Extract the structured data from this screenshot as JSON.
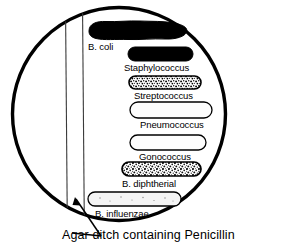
{
  "figure": {
    "caption": "Agar ditch containing Penicillin",
    "colors": {
      "ink": "#000000",
      "background": "#ffffff",
      "dish_outline": "#000000",
      "ditch_line": "#555555"
    },
    "plate": {
      "shape": "circle",
      "label": "petri-dish"
    },
    "ditch": {
      "label": "Agar ditch containing Penicillin",
      "orientation": "vertical",
      "left_line_x": 65,
      "right_line_x": 82
    },
    "streaks": [
      {
        "label": "B. coli",
        "growth": "heavy",
        "fill": "solid-black",
        "label_position": "below-left",
        "x": 85,
        "y": 21,
        "width": 102,
        "height": 19,
        "label_x": 88,
        "label_y": 42
      },
      {
        "label": "Staphylococcus",
        "growth": "heavy",
        "fill": "solid-black",
        "label_position": "below-left",
        "x": 128,
        "y": 47,
        "width": 65,
        "height": 14,
        "label_x": 124,
        "label_y": 63
      },
      {
        "label": "Streptococcus",
        "growth": "moderate",
        "fill": "stippled",
        "label_position": "below-left",
        "x": 129,
        "y": 76,
        "width": 72,
        "height": 13,
        "label_x": 134,
        "label_y": 91
      },
      {
        "label": "Pneumococcus",
        "growth": "inhibited",
        "fill": "outline",
        "label_position": "below-left",
        "x": 130,
        "y": 102,
        "width": 82,
        "height": 16,
        "label_x": 140,
        "label_y": 120
      },
      {
        "label": "Gonococcus",
        "growth": "inhibited",
        "fill": "outline",
        "label_position": "below-left",
        "x": 130,
        "y": 135,
        "width": 76,
        "height": 15,
        "label_x": 139,
        "label_y": 152
      },
      {
        "label": "B. diphtherial",
        "growth": "moderate",
        "fill": "stippled",
        "label_position": "below-left",
        "x": 122,
        "y": 162,
        "width": 79,
        "height": 14,
        "label_x": 122,
        "label_y": 179
      },
      {
        "label": "B. influenzae",
        "growth": "inhibited",
        "fill": "outline",
        "label_position": "below-left",
        "x": 88,
        "y": 192,
        "width": 93,
        "height": 14,
        "label_x": 95,
        "label_y": 209
      }
    ]
  }
}
